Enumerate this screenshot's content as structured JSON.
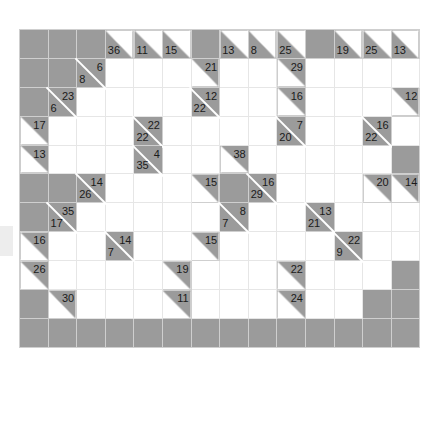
{
  "puzzle": {
    "title": "Kakuro puzzle grid",
    "rows": 11,
    "cols": 14,
    "colors": {
      "block": "#9b9b9b",
      "empty": "#ffffff",
      "grid_line": "#e6e6e6",
      "block_line": "#cfcfcf",
      "diagonal": "#ffffff",
      "clue_text": "#1a1a1a"
    },
    "legend": {
      "across_position": "upper-right triangle",
      "down_position": "lower-left triangle"
    },
    "grid": [
      [
        {
          "type": "block"
        },
        {
          "type": "block"
        },
        {
          "type": "block"
        },
        {
          "type": "clue",
          "down": "36"
        },
        {
          "type": "clue",
          "down": "11"
        },
        {
          "type": "clue",
          "down": "15"
        },
        {
          "type": "block"
        },
        {
          "type": "clue",
          "down": "13"
        },
        {
          "type": "clue",
          "down": "8"
        },
        {
          "type": "clue",
          "down": "25"
        },
        {
          "type": "block"
        },
        {
          "type": "clue",
          "down": "19"
        },
        {
          "type": "clue",
          "down": "25"
        },
        {
          "type": "clue",
          "down": "13"
        }
      ],
      [
        {
          "type": "block"
        },
        {
          "type": "block"
        },
        {
          "type": "clue",
          "across": "6",
          "down": "8"
        },
        {
          "type": "empty"
        },
        {
          "type": "empty"
        },
        {
          "type": "empty"
        },
        {
          "type": "clue",
          "across": "21"
        },
        {
          "type": "empty"
        },
        {
          "type": "empty"
        },
        {
          "type": "clue",
          "across": "29"
        },
        {
          "type": "empty"
        },
        {
          "type": "empty"
        },
        {
          "type": "empty"
        },
        {
          "type": "empty"
        }
      ],
      [
        {
          "type": "block"
        },
        {
          "type": "clue",
          "across": "23",
          "down": "6"
        },
        {
          "type": "empty"
        },
        {
          "type": "empty"
        },
        {
          "type": "empty"
        },
        {
          "type": "empty"
        },
        {
          "type": "clue",
          "across": "12",
          "down": "22"
        },
        {
          "type": "empty"
        },
        {
          "type": "empty"
        },
        {
          "type": "clue",
          "across": "16"
        },
        {
          "type": "empty"
        },
        {
          "type": "empty"
        },
        {
          "type": "empty"
        },
        {
          "type": "clue",
          "across": "12"
        }
      ],
      [
        {
          "type": "clue",
          "across": "17"
        },
        {
          "type": "empty"
        },
        {
          "type": "empty"
        },
        {
          "type": "empty"
        },
        {
          "type": "clue",
          "across": "22",
          "down": "22"
        },
        {
          "type": "empty"
        },
        {
          "type": "empty"
        },
        {
          "type": "empty"
        },
        {
          "type": "empty"
        },
        {
          "type": "clue",
          "across": "7",
          "down": "20"
        },
        {
          "type": "empty"
        },
        {
          "type": "empty"
        },
        {
          "type": "clue",
          "across": "16",
          "down": "22"
        },
        {
          "type": "empty"
        }
      ],
      [
        {
          "type": "clue",
          "across": "13"
        },
        {
          "type": "empty"
        },
        {
          "type": "empty"
        },
        {
          "type": "empty"
        },
        {
          "type": "clue",
          "across": "4",
          "down": "35"
        },
        {
          "type": "empty"
        },
        {
          "type": "empty"
        },
        {
          "type": "clue",
          "across": "38"
        },
        {
          "type": "empty"
        },
        {
          "type": "empty"
        },
        {
          "type": "empty"
        },
        {
          "type": "empty"
        },
        {
          "type": "empty"
        },
        {
          "type": "block"
        }
      ],
      [
        {
          "type": "block"
        },
        {
          "type": "block"
        },
        {
          "type": "clue",
          "across": "14",
          "down": "26"
        },
        {
          "type": "empty"
        },
        {
          "type": "empty"
        },
        {
          "type": "empty"
        },
        {
          "type": "clue",
          "across": "15"
        },
        {
          "type": "block"
        },
        {
          "type": "clue",
          "across": "16",
          "down": "29"
        },
        {
          "type": "empty"
        },
        {
          "type": "empty"
        },
        {
          "type": "empty"
        },
        {
          "type": "clue",
          "across": "20"
        },
        {
          "type": "clue",
          "across": "14"
        }
      ],
      [
        {
          "type": "block"
        },
        {
          "type": "clue",
          "across": "35",
          "down": "17"
        },
        {
          "type": "empty"
        },
        {
          "type": "empty"
        },
        {
          "type": "empty"
        },
        {
          "type": "empty"
        },
        {
          "type": "empty"
        },
        {
          "type": "clue",
          "across": "8",
          "down": "7"
        },
        {
          "type": "empty"
        },
        {
          "type": "empty"
        },
        {
          "type": "clue",
          "across": "13",
          "down": "21"
        },
        {
          "type": "empty"
        },
        {
          "type": "empty"
        },
        {
          "type": "empty"
        }
      ],
      [
        {
          "type": "clue",
          "across": "16"
        },
        {
          "type": "empty"
        },
        {
          "type": "empty"
        },
        {
          "type": "clue",
          "across": "14",
          "down": "7"
        },
        {
          "type": "empty"
        },
        {
          "type": "empty"
        },
        {
          "type": "clue",
          "across": "15"
        },
        {
          "type": "empty"
        },
        {
          "type": "empty"
        },
        {
          "type": "empty"
        },
        {
          "type": "empty"
        },
        {
          "type": "clue",
          "across": "22",
          "down": "9"
        },
        {
          "type": "empty"
        },
        {
          "type": "empty"
        }
      ],
      [
        {
          "type": "clue",
          "across": "26"
        },
        {
          "type": "empty"
        },
        {
          "type": "empty"
        },
        {
          "type": "empty"
        },
        {
          "type": "empty"
        },
        {
          "type": "clue",
          "across": "19"
        },
        {
          "type": "empty"
        },
        {
          "type": "empty"
        },
        {
          "type": "empty"
        },
        {
          "type": "clue",
          "across": "22"
        },
        {
          "type": "empty"
        },
        {
          "type": "empty"
        },
        {
          "type": "empty"
        },
        {
          "type": "block"
        }
      ],
      [
        {
          "type": "block"
        },
        {
          "type": "clue",
          "across": "30"
        },
        {
          "type": "empty"
        },
        {
          "type": "empty"
        },
        {
          "type": "empty"
        },
        {
          "type": "clue",
          "across": "11"
        },
        {
          "type": "empty"
        },
        {
          "type": "empty"
        },
        {
          "type": "empty"
        },
        {
          "type": "clue",
          "across": "24"
        },
        {
          "type": "empty"
        },
        {
          "type": "empty"
        },
        {
          "type": "block"
        },
        {
          "type": "block"
        }
      ],
      [
        {
          "type": "block"
        },
        {
          "type": "block"
        },
        {
          "type": "block"
        },
        {
          "type": "block"
        },
        {
          "type": "block"
        },
        {
          "type": "block"
        },
        {
          "type": "block"
        },
        {
          "type": "block"
        },
        {
          "type": "block"
        },
        {
          "type": "block"
        },
        {
          "type": "block"
        },
        {
          "type": "block"
        },
        {
          "type": "block"
        },
        {
          "type": "block"
        }
      ]
    ]
  }
}
